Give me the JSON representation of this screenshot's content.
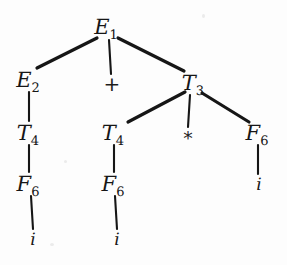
{
  "figure": {
    "kind": "parse-tree",
    "background_color": "#fdfdfd",
    "ink_color": "#161616",
    "width": 287,
    "height": 265
  },
  "nodes": [
    {
      "id": "E1",
      "symbol": "E",
      "subscript": "1",
      "kind": "nonterminal",
      "x": 106,
      "y": 27
    },
    {
      "id": "E2",
      "symbol": "E",
      "subscript": "2",
      "kind": "nonterminal",
      "x": 28,
      "y": 80
    },
    {
      "id": "PLUS",
      "symbol": "+",
      "subscript": "",
      "kind": "operator",
      "x": 112,
      "y": 84
    },
    {
      "id": "T3",
      "symbol": "T",
      "subscript": "3",
      "kind": "nonterminal",
      "x": 193,
      "y": 83
    },
    {
      "id": "T4L",
      "symbol": "T",
      "subscript": "4",
      "kind": "nonterminal",
      "x": 28,
      "y": 133
    },
    {
      "id": "T4M",
      "symbol": "T",
      "subscript": "4",
      "kind": "nonterminal",
      "x": 113,
      "y": 133
    },
    {
      "id": "STAR",
      "symbol": "*",
      "subscript": "",
      "kind": "operator",
      "x": 188,
      "y": 136
    },
    {
      "id": "F6R",
      "symbol": "F",
      "subscript": "6",
      "kind": "nonterminal",
      "x": 257,
      "y": 133
    },
    {
      "id": "F6L",
      "symbol": "F",
      "subscript": "6",
      "kind": "nonterminal",
      "x": 28,
      "y": 184
    },
    {
      "id": "F6M",
      "symbol": "F",
      "subscript": "6",
      "kind": "nonterminal",
      "x": 113,
      "y": 184
    },
    {
      "id": "IR",
      "symbol": "i",
      "subscript": "",
      "kind": "terminal",
      "x": 259,
      "y": 185
    },
    {
      "id": "IL",
      "symbol": "i",
      "subscript": "",
      "kind": "terminal",
      "x": 33,
      "y": 240
    },
    {
      "id": "IM",
      "symbol": "i",
      "subscript": "",
      "kind": "terminal",
      "x": 117,
      "y": 240
    }
  ],
  "edges": [
    {
      "from": "E1",
      "to": "E2",
      "x1": 97,
      "y1": 38,
      "x2": 37,
      "y2": 68
    },
    {
      "from": "E1",
      "to": "PLUS",
      "x1": 109,
      "y1": 40,
      "x2": 111,
      "y2": 74
    },
    {
      "from": "E1",
      "to": "T3",
      "x1": 118,
      "y1": 38,
      "x2": 184,
      "y2": 71
    },
    {
      "from": "E2",
      "to": "T4L",
      "x1": 29,
      "y1": 92,
      "x2": 29,
      "y2": 121
    },
    {
      "from": "T3",
      "to": "T4M",
      "x1": 185,
      "y1": 92,
      "x2": 128,
      "y2": 122
    },
    {
      "from": "T3",
      "to": "STAR",
      "x1": 190,
      "y1": 95,
      "x2": 188,
      "y2": 127
    },
    {
      "from": "T3",
      "to": "F6R",
      "x1": 202,
      "y1": 93,
      "x2": 249,
      "y2": 122
    },
    {
      "from": "T4L",
      "to": "F6L",
      "x1": 29,
      "y1": 145,
      "x2": 29,
      "y2": 172
    },
    {
      "from": "T4M",
      "to": "F6M",
      "x1": 114,
      "y1": 145,
      "x2": 114,
      "y2": 172
    },
    {
      "from": "F6R",
      "to": "IR",
      "x1": 258,
      "y1": 145,
      "x2": 258,
      "y2": 174
    },
    {
      "from": "F6L",
      "to": "IL",
      "x1": 31,
      "y1": 196,
      "x2": 33,
      "y2": 229
    },
    {
      "from": "F6M",
      "to": "IM",
      "x1": 115,
      "y1": 196,
      "x2": 117,
      "y2": 229
    }
  ],
  "specks": [
    {
      "x": 50,
      "y": 243,
      "w": 4,
      "h": 3
    },
    {
      "x": 202,
      "y": 14,
      "w": 3,
      "h": 4
    },
    {
      "x": 64,
      "y": 160,
      "w": 3,
      "h": 3
    }
  ]
}
